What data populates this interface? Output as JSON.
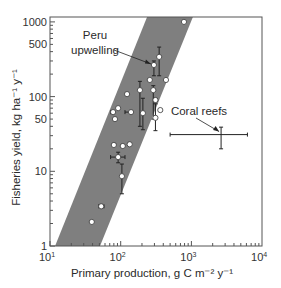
{
  "chart_data": {
    "type": "scatter",
    "title": "",
    "xlabel": "Primary production, g C m⁻² y⁻¹",
    "ylabel": "Fisheries yield, kg ha⁻¹ y⁻¹",
    "xscale": "log",
    "yscale": "log",
    "xlim": [
      10,
      10000
    ],
    "ylim": [
      1,
      1300
    ],
    "x_ticks": [
      {
        "value": 10,
        "label": "10",
        "exp": "1"
      },
      {
        "value": 100,
        "label": "10",
        "exp": "2"
      },
      {
        "value": 1000,
        "label": "10",
        "exp": "3"
      },
      {
        "value": 10000,
        "label": "10",
        "exp": "4"
      }
    ],
    "y_ticks": [
      {
        "value": 1,
        "label": "1"
      },
      {
        "value": 10,
        "label": "10"
      },
      {
        "value": 50,
        "label": "50"
      },
      {
        "value": 100,
        "label": "100"
      },
      {
        "value": 500,
        "label": "500"
      },
      {
        "value": 1000,
        "label": "1000"
      }
    ],
    "grid": false,
    "legend": null,
    "band": {
      "description": "Shaded envelope of fisheries yield vs primary production",
      "color": "#808080",
      "lower_edge": [
        [
          51,
          1
        ],
        [
          1050,
          1160
        ]
      ],
      "upper_edge": [
        [
          11.8,
          1
        ],
        [
          236,
          1160
        ]
      ]
    },
    "points": [
      {
        "x": 39,
        "y": 2.1
      },
      {
        "x": 53,
        "y": 3.4,
        "xerr": [
          49,
          58
        ]
      },
      {
        "x": 104,
        "y": 8.6,
        "yerr": [
          5,
          12.5
        ]
      },
      {
        "x": 92,
        "y": 15.5,
        "xerr": [
          72,
          115
        ],
        "yerr": [
          13,
          18
        ]
      },
      {
        "x": 80,
        "y": 22.5
      },
      {
        "x": 107,
        "y": 21.8
      },
      {
        "x": 134,
        "y": 23
      },
      {
        "x": 83,
        "y": 50
      },
      {
        "x": 78,
        "y": 62,
        "xerr": [
          72,
          78
        ]
      },
      {
        "x": 92,
        "y": 70
      },
      {
        "x": 140,
        "y": 62,
        "xerr": [
          115,
          140
        ]
      },
      {
        "x": 123,
        "y": 108
      },
      {
        "x": 187,
        "y": 122,
        "yerr": [
          40,
          160
        ]
      },
      {
        "x": 206,
        "y": 60,
        "yerr": [
          36,
          95
        ]
      },
      {
        "x": 289,
        "y": 122,
        "yerr": [
          50,
          140
        ]
      },
      {
        "x": 310,
        "y": 90
      },
      {
        "x": 363,
        "y": 66
      },
      {
        "x": 310,
        "y": 52,
        "yerr": [
          35,
          80
        ]
      },
      {
        "x": 258,
        "y": 167
      },
      {
        "x": 437,
        "y": 167
      },
      {
        "x": 295,
        "y": 265,
        "yerr": [
          190,
          300
        ],
        "label": "Peru upwelling"
      },
      {
        "x": 350,
        "y": 340,
        "yerr": [
          190,
          460
        ]
      },
      {
        "x": 785,
        "y": 1000
      }
    ],
    "coral_reefs": {
      "label": "Coral reefs",
      "x": 2630,
      "y": 31,
      "xerr": [
        500,
        6200
      ],
      "yerr": [
        20,
        39
      ]
    },
    "annotations": [
      {
        "text_lines": [
          "Peru",
          "upwelling"
        ],
        "points_to": "Peru upwelling"
      },
      {
        "text_lines": [
          "Coral reefs"
        ],
        "points_to": "coral_reefs"
      }
    ]
  },
  "style": {
    "band_color": "#7f7f7f",
    "axis_color": "#555555",
    "point_fill": "#ffffff",
    "point_stroke": "#333333",
    "errbar_color": "#222222"
  }
}
